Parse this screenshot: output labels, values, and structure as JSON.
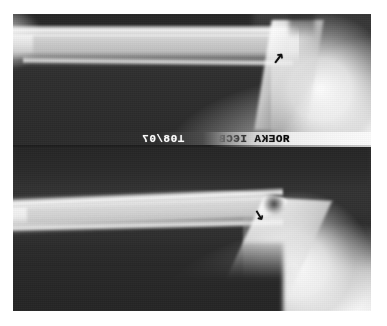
{
  "image": {
    "modality": "x-ray",
    "description": "Two-panel radiograph of a long bone shaft and adjacent joint",
    "panel_count": 2,
    "frame_color": "#ffffff",
    "background_color": "#2a2a2a",
    "bone_color": "#f4f4f4",
    "marker_color": "#0d0d0d"
  },
  "panels": [
    {
      "id": "upper",
      "label": "upper-radiograph-panel",
      "view": "lateral",
      "marker": {
        "name": "arrow-marker",
        "glyph": "↗",
        "points_to": "cortical-lesion-at-metaphysis"
      }
    },
    {
      "id": "lower",
      "label": "lower-radiograph-panel",
      "view": "oblique",
      "marker": {
        "name": "arrow-marker",
        "glyph": "↘",
        "points_to": "cortical-lesion-at-metaphysis"
      }
    }
  ],
  "film_annotations": {
    "left_text": "⊥08/07",
    "right_text": "ЯОЕКА ІЄСВ",
    "mirrored": true,
    "burned_in": true
  }
}
